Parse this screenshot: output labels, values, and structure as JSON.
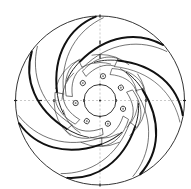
{
  "figure": {
    "vane_count": 7,
    "bolt_hole_count": 7,
    "colors": {
      "line": "#1e1e1e",
      "background": "#ffffff"
    }
  }
}
